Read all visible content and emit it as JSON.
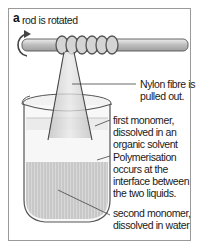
{
  "figure": {
    "panel_letter": "a",
    "labels": {
      "rod": "rod is rotated",
      "fibre_line1": "Nylon fibre is",
      "fibre_line2": "pulled out.",
      "first_line1": "first monomer,",
      "first_line2": "dissolved in an",
      "first_line3": "organic solvent",
      "poly_line1": "Polymerisation",
      "poly_line2": "occurs at the",
      "poly_line3": "interface between",
      "poly_line4": "the two liquids.",
      "second_line1": "second monomer,",
      "second_line2": "dissolved in water"
    },
    "colors": {
      "frame": "#9a9a9a",
      "rod": "#c8c8c8",
      "outline": "#555555",
      "upper_liquid": "#ececec",
      "lower_liquid": "#cfcfcf",
      "fibre": "#d9d9d9"
    }
  }
}
